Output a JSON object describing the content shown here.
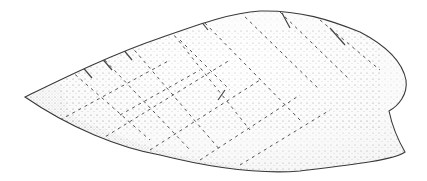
{
  "figure": {
    "style": "pen-and-ink stipple drawing",
    "background": "#ffffff",
    "ink_color": "#3a3a3a",
    "fill_color": "#f2f2f2"
  }
}
